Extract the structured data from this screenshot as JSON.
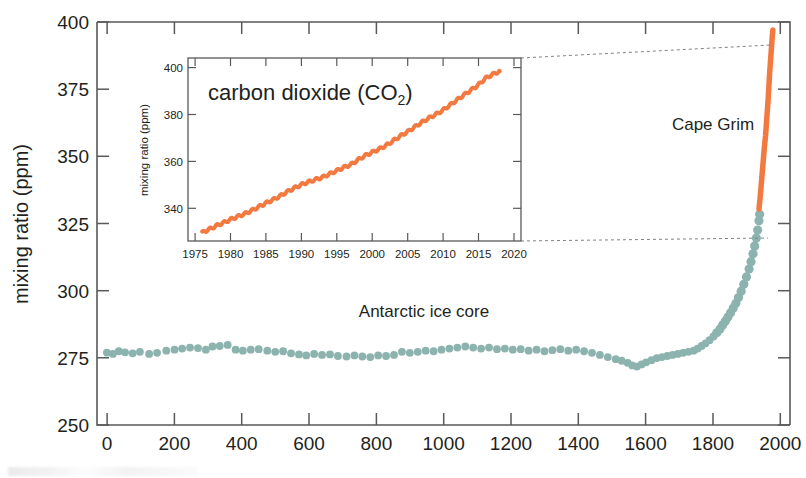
{
  "figure": {
    "background_color": "#ffffff"
  },
  "colors": {
    "ice_core": "#8cb3ae",
    "cape_grim": "#f2793f",
    "axis": "#58595b",
    "text": "#231f20",
    "connector": "#808285"
  },
  "main_axes": {
    "ylabel": "mixing ratio (ppm)",
    "ytick_labels": [
      "250",
      "275",
      "300",
      "325",
      "350",
      "375",
      "400"
    ],
    "xtick_labels": [
      "0",
      "200",
      "400",
      "600",
      "800",
      "1000",
      "1200",
      "1400",
      "1600",
      "1800",
      "2000"
    ],
    "annotations": [
      {
        "name": "ice-core-label",
        "text": "Antarctic ice core"
      },
      {
        "name": "cape-grim-label",
        "text": "Cape Grim"
      }
    ]
  },
  "inset_axes": {
    "title_main": "carbon dioxide (CO",
    "title_sub": "2",
    "title_close": ")",
    "ylabel": "mixing ratio (ppm)",
    "ytick_labels": [
      "340",
      "360",
      "380",
      "400"
    ],
    "xtick_labels": [
      "1975",
      "1980",
      "1985",
      "1990",
      "1995",
      "2000",
      "2005",
      "2010",
      "2015",
      "2020"
    ]
  },
  "chart_data": {
    "type": "scatter",
    "title": "carbon dioxide (CO2)",
    "xlabel": "",
    "ylabel": "mixing ratio (ppm)",
    "xlim": [
      -30,
      2070
    ],
    "ylim": [
      250,
      403
    ],
    "grid": false,
    "legend": "none",
    "series": [
      {
        "name": "Antarctic ice core",
        "color": "#8cb3ae",
        "marker": "circle",
        "x": [
          0,
          18,
          36,
          55,
          78,
          100,
          128,
          152,
          180,
          205,
          228,
          252,
          276,
          300,
          320,
          342,
          366,
          390,
          412,
          436,
          460,
          486,
          510,
          534,
          558,
          582,
          604,
          628,
          652,
          676,
          700,
          726,
          750,
          774,
          798,
          822,
          846,
          870,
          894,
          918,
          942,
          966,
          990,
          1014,
          1038,
          1062,
          1086,
          1110,
          1134,
          1158,
          1182,
          1206,
          1230,
          1254,
          1278,
          1302,
          1326,
          1350,
          1374,
          1398,
          1422,
          1446,
          1470,
          1494,
          1518,
          1542,
          1560,
          1578,
          1592,
          1606,
          1620,
          1634,
          1650,
          1666,
          1682,
          1698,
          1714,
          1730,
          1746,
          1762,
          1778,
          1790,
          1802,
          1814,
          1826,
          1838,
          1848,
          1858,
          1866,
          1874,
          1882,
          1890,
          1898,
          1906,
          1914,
          1922,
          1930,
          1938,
          1946,
          1952,
          1958,
          1963,
          1968,
          1972,
          1976,
          1978
        ],
        "y": [
          277.5,
          277.0,
          278.0,
          277.6,
          277.2,
          277.8,
          277.0,
          277.4,
          278.2,
          278.6,
          279.0,
          279.4,
          279.2,
          278.6,
          279.8,
          280.0,
          280.4,
          278.6,
          278.2,
          278.6,
          278.8,
          278.2,
          277.8,
          278.0,
          277.2,
          276.8,
          276.4,
          277.0,
          276.6,
          276.8,
          276.2,
          276.0,
          276.4,
          276.0,
          275.8,
          276.4,
          276.2,
          276.6,
          277.8,
          277.4,
          277.8,
          278.2,
          278.0,
          278.6,
          279.0,
          279.4,
          279.8,
          279.4,
          279.0,
          279.4,
          278.8,
          279.0,
          278.6,
          278.8,
          278.2,
          278.6,
          278.0,
          278.4,
          278.8,
          278.2,
          278.6,
          278.0,
          277.4,
          276.6,
          275.8,
          275.0,
          274.4,
          273.6,
          272.6,
          272.2,
          273.0,
          273.8,
          274.6,
          275.4,
          275.8,
          276.2,
          276.6,
          277.0,
          277.4,
          277.8,
          278.2,
          279.0,
          280.0,
          281.0,
          282.2,
          283.6,
          285.0,
          286.4,
          288.0,
          289.4,
          291.0,
          292.6,
          294.4,
          296.2,
          298.4,
          300.8,
          303.4,
          306.2,
          309.2,
          312.0,
          315.0,
          318.0,
          321.0,
          324.0,
          327.5,
          330.0
        ]
      },
      {
        "name": "Cape Grim",
        "color": "#f2793f",
        "marker": "line",
        "x": [
          1976,
          1980,
          1984,
          1988,
          1992,
          1996,
          2000,
          2004,
          2008,
          2012,
          2016,
          2018
        ],
        "y": [
          332,
          337,
          343,
          349,
          355,
          360,
          367,
          374,
          383,
          390,
          397,
          400
        ]
      }
    ],
    "inset": {
      "type": "line",
      "title": "carbon dioxide (CO2)",
      "xlabel": "",
      "ylabel": "mixing ratio (ppm)",
      "xlim": [
        1974,
        2021
      ],
      "ylim": [
        328,
        406
      ],
      "grid": false,
      "color": "#f2793f",
      "series_name": "Cape Grim CO2 mixing ratio",
      "x": [
        1976.0,
        1977.0,
        1978.0,
        1979.0,
        1980.0,
        1981.0,
        1982.0,
        1983.0,
        1984.0,
        1985.0,
        1986.0,
        1987.0,
        1988.0,
        1989.0,
        1990.0,
        1991.0,
        1992.0,
        1993.0,
        1994.0,
        1995.0,
        1996.0,
        1997.0,
        1998.0,
        1999.0,
        2000.0,
        2001.0,
        2002.0,
        2003.0,
        2004.0,
        2005.0,
        2006.0,
        2007.0,
        2008.0,
        2009.0,
        2010.0,
        2011.0,
        2012.0,
        2013.0,
        2014.0,
        2015.0,
        2016.0,
        2017.0,
        2018.0
      ],
      "y": [
        331.6,
        333.0,
        334.5,
        335.8,
        337.2,
        338.4,
        339.6,
        341.0,
        342.6,
        344.2,
        345.6,
        347.2,
        349.0,
        350.6,
        352.0,
        353.2,
        354.2,
        355.2,
        356.6,
        358.0,
        359.4,
        360.6,
        362.6,
        364.4,
        365.8,
        367.2,
        368.8,
        370.8,
        372.8,
        374.6,
        376.6,
        378.6,
        380.4,
        382.0,
        383.8,
        386.0,
        388.2,
        390.4,
        392.4,
        394.6,
        397.4,
        399.0,
        400.4
      ]
    }
  }
}
